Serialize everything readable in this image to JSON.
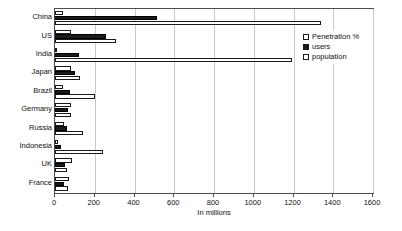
{
  "chart_data": {
    "type": "bar",
    "orientation": "horizontal",
    "title": "",
    "xlabel": "In millions",
    "ylabel": "",
    "xlim": [
      0,
      1600
    ],
    "xticks": [
      0,
      200,
      400,
      600,
      800,
      1000,
      1200,
      1400,
      1600
    ],
    "grid": true,
    "legend_position": "top-right",
    "categories": [
      "China",
      "US",
      "India",
      "Japan",
      "Brazil",
      "Germany",
      "Russia",
      "Indonesia",
      "UK",
      "France"
    ],
    "series": [
      {
        "name": "Penetration %",
        "values": [
          38,
          78,
          8,
          79,
          39,
          79,
          43,
          13,
          84,
          70
        ]
      },
      {
        "name": "users",
        "values": [
          513,
          256,
          120,
          99,
          76,
          65,
          60,
          30,
          51,
          45
        ]
      },
      {
        "name": "population",
        "values": [
          1340,
          308,
          1190,
          127,
          199,
          82,
          140,
          240,
          62,
          65
        ]
      }
    ]
  },
  "legend": {
    "items": [
      {
        "label": "Penetration %",
        "swatch": "pen"
      },
      {
        "label": "users",
        "swatch": "users"
      },
      {
        "label": "population",
        "swatch": "pop"
      }
    ]
  },
  "axis": {
    "x_title": "In millions"
  }
}
